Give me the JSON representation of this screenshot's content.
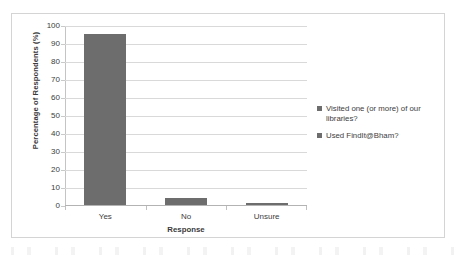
{
  "chart_data": {
    "type": "bar",
    "title": "",
    "categories": [
      "Yes",
      "No",
      "Unsure"
    ],
    "values": [
      95,
      4,
      1
    ],
    "series": [
      {
        "name": "Percentage of Respondents",
        "values": [
          95,
          4,
          1
        ]
      }
    ],
    "xlabel": "Response",
    "ylabel": "Percentage of Respondents (%)",
    "ylim": [
      0,
      100
    ],
    "ytick_step": 10,
    "yticks": [
      "100",
      "90",
      "80",
      "70",
      "60",
      "50",
      "40",
      "30",
      "20",
      "10",
      "0"
    ],
    "grid": true,
    "legend_position": "right",
    "legend": [
      "Visited one (or more) of our libraries?",
      "Used FindIt@Bham?"
    ],
    "bar_color": "#6d6d6d",
    "gridline_color": "#d9d9d9",
    "frame_color": "#d4d4d4"
  }
}
